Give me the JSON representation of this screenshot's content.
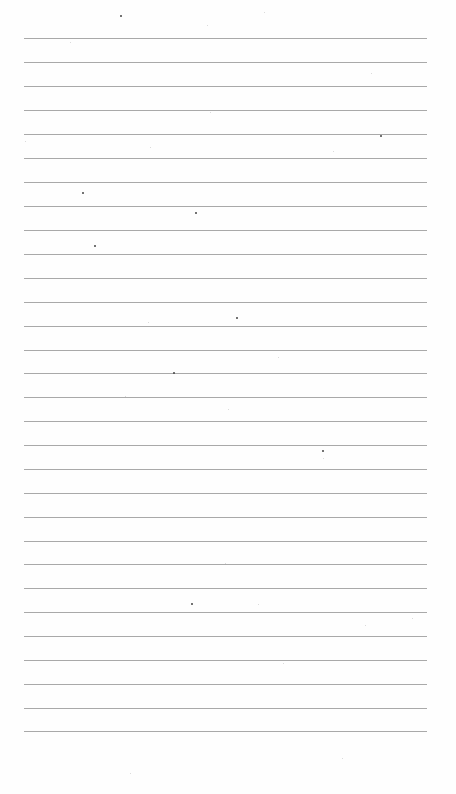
{
  "page": {
    "type": "blank-ruled-paper",
    "background_color": "#fefefe",
    "rule_color": "#9a9a9a",
    "rule_left": 24,
    "rule_right": 427,
    "rule_count": 30,
    "rule_spacing": 23.9,
    "rule_positions_y": [
      38,
      62,
      86,
      110,
      134,
      158,
      182,
      206,
      230,
      254,
      278,
      302,
      326,
      350,
      373,
      397,
      421,
      445,
      469,
      493,
      517,
      541,
      564,
      588,
      612,
      636,
      660,
      684,
      708,
      731
    ]
  },
  "specks": [
    {
      "x": 120,
      "y": 15,
      "t": "dark"
    },
    {
      "x": 207,
      "y": 25,
      "t": "light"
    },
    {
      "x": 264,
      "y": 12,
      "t": "light"
    },
    {
      "x": 371,
      "y": 73,
      "t": "light"
    },
    {
      "x": 70,
      "y": 42,
      "t": "light"
    },
    {
      "x": 210,
      "y": 112,
      "t": "light"
    },
    {
      "x": 380,
      "y": 135,
      "t": "dark"
    },
    {
      "x": 25,
      "y": 141,
      "t": "light"
    },
    {
      "x": 150,
      "y": 147,
      "t": "light"
    },
    {
      "x": 333,
      "y": 151,
      "t": "light"
    },
    {
      "x": 82,
      "y": 192,
      "t": "dark"
    },
    {
      "x": 195,
      "y": 212,
      "t": "dark"
    },
    {
      "x": 94,
      "y": 245,
      "t": "dark"
    },
    {
      "x": 236,
      "y": 317,
      "t": "dark"
    },
    {
      "x": 148,
      "y": 322,
      "t": "light"
    },
    {
      "x": 278,
      "y": 357,
      "t": "light"
    },
    {
      "x": 173,
      "y": 372,
      "t": "dark"
    },
    {
      "x": 125,
      "y": 396,
      "t": "light"
    },
    {
      "x": 228,
      "y": 409,
      "t": "light"
    },
    {
      "x": 322,
      "y": 450,
      "t": "dark"
    },
    {
      "x": 323,
      "y": 458,
      "t": "light"
    },
    {
      "x": 225,
      "y": 563,
      "t": "light"
    },
    {
      "x": 191,
      "y": 603,
      "t": "dark"
    },
    {
      "x": 258,
      "y": 604,
      "t": "light"
    },
    {
      "x": 365,
      "y": 625,
      "t": "light"
    },
    {
      "x": 412,
      "y": 618,
      "t": "light"
    },
    {
      "x": 283,
      "y": 663,
      "t": "light"
    },
    {
      "x": 342,
      "y": 758,
      "t": "light"
    },
    {
      "x": 130,
      "y": 773,
      "t": "light"
    }
  ]
}
